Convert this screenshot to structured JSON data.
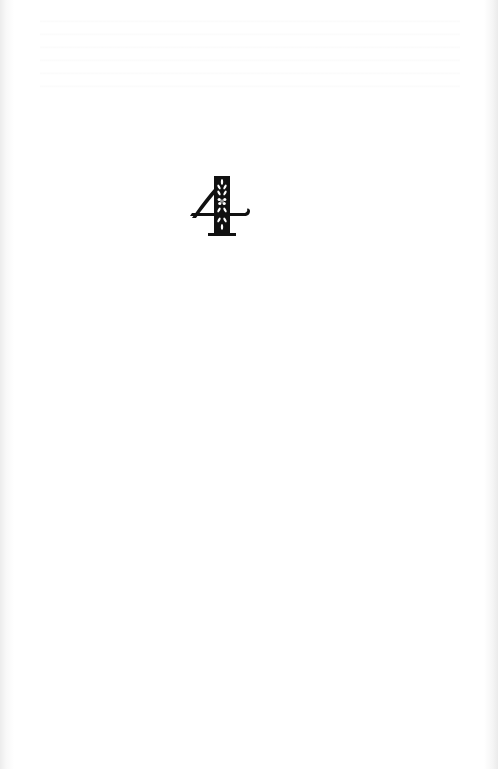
{
  "page": {
    "type": "chapter-opening",
    "chapter_number": "4",
    "chapter_numeral_style": "decorative ornamental numeral with floral cutouts",
    "ink_color": "#111111",
    "paper_color": "#fdfdfd"
  }
}
